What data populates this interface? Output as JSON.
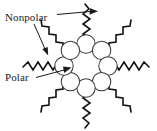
{
  "figure": {
    "background_color": "#ffffff",
    "width": 157,
    "height": 131
  },
  "labels": {
    "nonpolar": "Nonpolar",
    "polar": "Polar"
  },
  "colors": {
    "text": "#1a1a1a",
    "head_stroke": "#3d3d3d",
    "head_fill": "#ffffff",
    "tail_stroke": "#111111",
    "leader": "#1a1a1a"
  },
  "structure": {
    "head_count": 8,
    "tail_count": 8,
    "head_group_name": "polar-head",
    "tail_group_name": "nonpolar-tail",
    "arrangement": "octagonal ring",
    "center_x": 86,
    "center_y": 66,
    "ring_radius": 22,
    "head_radius": 9.2
  },
  "annotations": [
    {
      "name": "nonpolar-horizontal-pointer",
      "label": "Nonpolar",
      "from": [
        57,
        14
      ],
      "to": [
        97,
        11
      ],
      "points_to": "top vertical tail"
    },
    {
      "name": "nonpolar-diagonal-pointer",
      "label": "Nonpolar",
      "from": [
        34,
        24
      ],
      "to": [
        47,
        53
      ],
      "points_to": "upper-left tail"
    },
    {
      "name": "polar-pointer",
      "label": "Polar",
      "from": [
        36,
        77
      ],
      "to": [
        70,
        68
      ],
      "points_to": "left head group"
    }
  ],
  "tails": [
    {
      "name": "tail-n",
      "angle_deg": 270,
      "style": "vertical zigzag up"
    },
    {
      "name": "tail-ne",
      "angle_deg": 315,
      "style": "diagonal zigzag up-right"
    },
    {
      "name": "tail-e",
      "angle_deg": 0,
      "style": "horizontal zigzag right"
    },
    {
      "name": "tail-se",
      "angle_deg": 45,
      "style": "diagonal zigzag down-right"
    },
    {
      "name": "tail-s",
      "angle_deg": 90,
      "style": "vertical zigzag down"
    },
    {
      "name": "tail-sw",
      "angle_deg": 135,
      "style": "diagonal zigzag down-left"
    },
    {
      "name": "tail-w",
      "angle_deg": 180,
      "style": "horizontal zigzag left"
    },
    {
      "name": "tail-nw",
      "angle_deg": 225,
      "style": "diagonal zigzag up-left"
    }
  ]
}
